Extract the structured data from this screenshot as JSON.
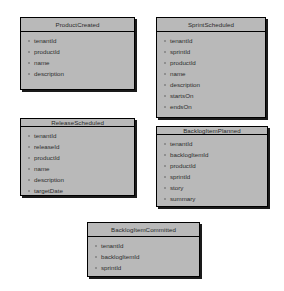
{
  "diagram": {
    "type": "uml-class-diagram",
    "background_color": "#ffffff",
    "box_fill_color": "#b9b9b9",
    "box_border_color": "#000000",
    "shadow_color": "#1a1a1a",
    "boxes": [
      {
        "title": "ProductCreated",
        "attributes": [
          "tenantId",
          "productId",
          "name",
          "description"
        ],
        "x": 20,
        "y": 17,
        "width": 115,
        "height": 73
      },
      {
        "title": "SprintScheduled",
        "attributes": [
          "tenantId",
          "sprintId",
          "productId",
          "name",
          "description",
          "startsOn",
          "endsOn"
        ],
        "x": 156,
        "y": 17,
        "width": 110,
        "height": 101
      },
      {
        "title": "ReleaseScheduled",
        "attributes": [
          "tenantId",
          "releaseId",
          "productId",
          "name",
          "description",
          "targetDate"
        ],
        "x": 20,
        "y": 118,
        "width": 115,
        "height": 78
      },
      {
        "title": "BacklogItemPlanned",
        "attributes": [
          "tenantId",
          "backlogItemId",
          "productId",
          "sprintId",
          "story",
          "summary"
        ],
        "x": 156,
        "y": 126,
        "width": 112,
        "height": 81
      },
      {
        "title": "BacklogItemCommitted",
        "attributes": [
          "tenantId",
          "backlogItemId",
          "sprintId"
        ],
        "x": 87,
        "y": 222,
        "width": 113,
        "height": 55
      }
    ]
  }
}
